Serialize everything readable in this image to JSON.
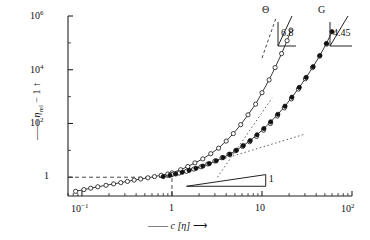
{
  "chart_data": {
    "type": "scatter",
    "title": "",
    "xlabel": "c [η]",
    "ylabel": "ηrel − 1",
    "xscale": "log",
    "yscale": "log",
    "xlim": [
      0.07,
      100
    ],
    "ylim": [
      0.2,
      1000000
    ],
    "xticks": [
      "10⁻¹",
      "1",
      "10",
      "10²"
    ],
    "xtick_values": [
      0.1,
      1,
      10,
      100
    ],
    "yticks": [
      "1",
      "10²",
      "10⁴",
      "10⁶"
    ],
    "ytick_values": [
      1,
      100,
      10000,
      1000000
    ],
    "grid": false,
    "legend": "none",
    "annotations": [
      {
        "name": "theta-branch-label",
        "text": "Θ",
        "x": 22,
        "y": 300000,
        "slope": 6.8,
        "slope_label": "6.8"
      },
      {
        "name": "good-solvent-branch-label",
        "text": "G",
        "x": 62,
        "y": 300000,
        "slope": 4.45,
        "slope_label": "4.45"
      },
      {
        "name": "slope-one-triangle",
        "text": "1",
        "slope": 1,
        "slope_label": "1"
      }
    ],
    "reference_lines": [
      {
        "name": "unity-horizontal",
        "style": "dashed",
        "y": 1,
        "from_x": 0.07,
        "to_x": 1
      },
      {
        "name": "unity-vertical",
        "style": "dashed",
        "x": 1,
        "from_y": 0.2,
        "to_y": 1
      }
    ],
    "series": [
      {
        "name": "theta-solvent",
        "marker": "open-circle",
        "slope_high_c": 6.8,
        "points": [
          [
            0.085,
            0.3
          ],
          [
            0.105,
            0.345
          ],
          [
            0.125,
            0.39
          ],
          [
            0.15,
            0.44
          ],
          [
            0.185,
            0.5
          ],
          [
            0.225,
            0.565
          ],
          [
            0.27,
            0.63
          ],
          [
            0.32,
            0.7
          ],
          [
            0.38,
            0.78
          ],
          [
            0.45,
            0.86
          ],
          [
            0.54,
            0.95
          ],
          [
            0.64,
            1.05
          ],
          [
            0.76,
            1.18
          ],
          [
            0.9,
            1.32
          ],
          [
            1.0,
            1.45
          ],
          [
            1.25,
            1.9
          ],
          [
            1.5,
            2.5
          ],
          [
            1.8,
            3.4
          ],
          [
            2.2,
            4.8
          ],
          [
            2.7,
            7.5
          ],
          [
            3.3,
            12
          ],
          [
            4.0,
            22
          ],
          [
            4.8,
            42
          ],
          [
            5.8,
            90
          ],
          [
            7.0,
            210
          ],
          [
            8.5,
            520
          ],
          [
            10.0,
            1400
          ],
          [
            12.0,
            4200
          ],
          [
            14.0,
            12000
          ],
          [
            16.5,
            40000
          ],
          [
            19.0,
            120000
          ],
          [
            21.0,
            300000
          ]
        ]
      },
      {
        "name": "good-solvent",
        "marker": "filled-circle",
        "slope_high_c": 4.45,
        "points": [
          [
            0.8,
            1.05
          ],
          [
            0.95,
            1.18
          ],
          [
            1.1,
            1.32
          ],
          [
            1.3,
            1.52
          ],
          [
            1.55,
            1.8
          ],
          [
            1.85,
            2.15
          ],
          [
            2.2,
            2.6
          ],
          [
            2.6,
            3.2
          ],
          [
            3.1,
            4.1
          ],
          [
            3.7,
            5.4
          ],
          [
            4.4,
            7.2
          ],
          [
            5.2,
            10
          ],
          [
            6.2,
            15
          ],
          [
            7.4,
            23
          ],
          [
            8.8,
            38
          ],
          [
            10.5,
            65
          ],
          [
            12.5,
            115
          ],
          [
            15.0,
            220
          ],
          [
            18.0,
            440
          ],
          [
            21.5,
            950
          ],
          [
            26.0,
            2200
          ],
          [
            31.0,
            5200
          ],
          [
            37.0,
            13000
          ],
          [
            44.0,
            34000
          ],
          [
            52.0,
            95000
          ],
          [
            60.0,
            260000
          ]
        ]
      },
      {
        "name": "good-solvent-open",
        "marker": "open-circle",
        "points": [
          [
            1.0,
            1.25
          ],
          [
            1.2,
            1.42
          ],
          [
            1.45,
            1.66
          ],
          [
            1.75,
            2.0
          ],
          [
            2.1,
            2.45
          ],
          [
            2.5,
            3.1
          ],
          [
            3.0,
            4.0
          ],
          [
            3.6,
            5.3
          ],
          [
            4.3,
            7.1
          ],
          [
            5.1,
            9.8
          ],
          [
            6.1,
            14
          ],
          [
            7.3,
            21
          ],
          [
            8.7,
            33
          ],
          [
            10.4,
            56
          ],
          [
            12.4,
            100
          ],
          [
            14.8,
            190
          ],
          [
            17.7,
            380
          ],
          [
            21.2,
            820
          ],
          [
            25.4,
            1900
          ],
          [
            30.4,
            4600
          ],
          [
            36.4,
            12000
          ],
          [
            43.6,
            32000
          ],
          [
            52.2,
            90000
          ]
        ]
      }
    ]
  },
  "axes": {
    "x_axis_label_prefix": "——",
    "x_axis_label_arrow": "⟶",
    "y_axis_label_prefix": "——",
    "y_axis_label_arrow": "↑"
  }
}
